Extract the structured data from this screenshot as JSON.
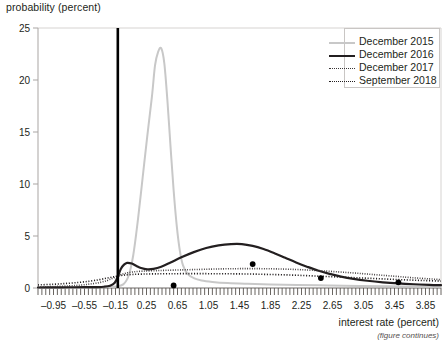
{
  "chart_data": {
    "type": "line",
    "title": "",
    "ylabel": "probability (percent)",
    "xlabel": "interest rate (percent)",
    "note": "(figure continues)",
    "grid": false,
    "legend_position": "top-right",
    "xlim": [
      -1.15,
      4.05
    ],
    "ylim": [
      0,
      25
    ],
    "xticks": [
      "-0.95",
      "-0.55",
      "-0.15",
      "0.25",
      "0.65",
      "1.05",
      "1.45",
      "1.85",
      "2.25",
      "2.65",
      "3.05",
      "3.45",
      "3.85"
    ],
    "xtick_values": [
      -0.95,
      -0.55,
      -0.15,
      0.25,
      0.65,
      1.05,
      1.45,
      1.85,
      2.25,
      2.65,
      3.05,
      3.45,
      3.85
    ],
    "xtick_minor_step": 0.05,
    "yticks": [
      "0",
      "5",
      "10",
      "15",
      "20",
      "25"
    ],
    "ytick_values": [
      0,
      5,
      10,
      15,
      20,
      25
    ],
    "vertical_marker": {
      "label": "",
      "x": -0.12,
      "color": "#000000"
    },
    "markers": {
      "color": "#000000",
      "points": [
        {
          "x": 0.6,
          "y": 0.25
        },
        {
          "x": 1.62,
          "y": 2.3
        },
        {
          "x": 2.5,
          "y": 0.95
        },
        {
          "x": 3.5,
          "y": 0.55
        }
      ]
    },
    "series": [
      {
        "name": "December 2015",
        "color": "#c8c8c8",
        "style": "solid",
        "width": 2.0,
        "points": [
          [
            -1.15,
            0.02
          ],
          [
            -0.95,
            0.03
          ],
          [
            -0.75,
            0.04
          ],
          [
            -0.55,
            0.05
          ],
          [
            -0.4,
            0.07
          ],
          [
            -0.25,
            0.1
          ],
          [
            -0.15,
            0.15
          ],
          [
            -0.05,
            0.35
          ],
          [
            0.02,
            1.2
          ],
          [
            0.08,
            3.2
          ],
          [
            0.14,
            6.6
          ],
          [
            0.2,
            10.6
          ],
          [
            0.26,
            14.6
          ],
          [
            0.32,
            18.4
          ],
          [
            0.36,
            21.4
          ],
          [
            0.4,
            22.7
          ],
          [
            0.44,
            23.05
          ],
          [
            0.48,
            21.6
          ],
          [
            0.52,
            18.0
          ],
          [
            0.56,
            13.6
          ],
          [
            0.6,
            9.4
          ],
          [
            0.64,
            6.0
          ],
          [
            0.68,
            3.6
          ],
          [
            0.72,
            2.2
          ],
          [
            0.78,
            1.35
          ],
          [
            0.86,
            0.95
          ],
          [
            0.96,
            0.72
          ],
          [
            1.1,
            0.58
          ],
          [
            1.3,
            0.47
          ],
          [
            1.55,
            0.4
          ],
          [
            1.85,
            0.34
          ],
          [
            2.2,
            0.29
          ],
          [
            2.6,
            0.24
          ],
          [
            3.0,
            0.2
          ],
          [
            3.4,
            0.16
          ],
          [
            3.8,
            0.13
          ],
          [
            4.05,
            0.11
          ]
        ]
      },
      {
        "name": "December 2016",
        "color": "#231f20",
        "style": "solid",
        "width": 2.2,
        "points": [
          [
            -1.15,
            0.05
          ],
          [
            -0.95,
            0.06
          ],
          [
            -0.75,
            0.07
          ],
          [
            -0.55,
            0.08
          ],
          [
            -0.4,
            0.09
          ],
          [
            -0.3,
            0.12
          ],
          [
            -0.22,
            0.22
          ],
          [
            -0.16,
            0.5
          ],
          [
            -0.12,
            1.1
          ],
          [
            -0.08,
            1.85
          ],
          [
            -0.04,
            2.25
          ],
          [
            0.0,
            2.42
          ],
          [
            0.06,
            2.35
          ],
          [
            0.12,
            2.12
          ],
          [
            0.18,
            1.92
          ],
          [
            0.26,
            1.8
          ],
          [
            0.34,
            1.84
          ],
          [
            0.44,
            2.05
          ],
          [
            0.56,
            2.45
          ],
          [
            0.7,
            2.95
          ],
          [
            0.86,
            3.45
          ],
          [
            1.02,
            3.85
          ],
          [
            1.18,
            4.1
          ],
          [
            1.34,
            4.22
          ],
          [
            1.48,
            4.22
          ],
          [
            1.62,
            4.05
          ],
          [
            1.76,
            3.75
          ],
          [
            1.9,
            3.35
          ],
          [
            2.04,
            2.9
          ],
          [
            2.18,
            2.45
          ],
          [
            2.32,
            2.05
          ],
          [
            2.46,
            1.68
          ],
          [
            2.6,
            1.38
          ],
          [
            2.76,
            1.1
          ],
          [
            2.92,
            0.88
          ],
          [
            3.1,
            0.7
          ],
          [
            3.3,
            0.55
          ],
          [
            3.5,
            0.44
          ],
          [
            3.7,
            0.36
          ],
          [
            3.9,
            0.3
          ],
          [
            4.05,
            0.27
          ]
        ]
      },
      {
        "name": "December 2017",
        "color": "#3b3637",
        "style": "dotted-fine",
        "width": 1.6,
        "points": [
          [
            -1.15,
            0.1
          ],
          [
            -0.95,
            0.14
          ],
          [
            -0.75,
            0.2
          ],
          [
            -0.6,
            0.28
          ],
          [
            -0.48,
            0.38
          ],
          [
            -0.36,
            0.52
          ],
          [
            -0.26,
            0.72
          ],
          [
            -0.18,
            0.96
          ],
          [
            -0.1,
            1.22
          ],
          [
            -0.02,
            1.42
          ],
          [
            0.08,
            1.55
          ],
          [
            0.2,
            1.62
          ],
          [
            0.34,
            1.66
          ],
          [
            0.5,
            1.7
          ],
          [
            0.7,
            1.74
          ],
          [
            0.9,
            1.78
          ],
          [
            1.1,
            1.82
          ],
          [
            1.3,
            1.85
          ],
          [
            1.5,
            1.86
          ],
          [
            1.7,
            1.86
          ],
          [
            1.9,
            1.84
          ],
          [
            2.1,
            1.8
          ],
          [
            2.3,
            1.74
          ],
          [
            2.5,
            1.66
          ],
          [
            2.7,
            1.56
          ],
          [
            2.9,
            1.46
          ],
          [
            3.1,
            1.34
          ],
          [
            3.3,
            1.22
          ],
          [
            3.5,
            1.1
          ],
          [
            3.7,
            0.98
          ],
          [
            3.9,
            0.88
          ],
          [
            4.05,
            0.8
          ]
        ]
      },
      {
        "name": "September 2018",
        "color": "#231f20",
        "style": "dotted",
        "width": 1.6,
        "points": [
          [
            -1.15,
            0.3
          ],
          [
            -0.95,
            0.36
          ],
          [
            -0.78,
            0.44
          ],
          [
            -0.62,
            0.54
          ],
          [
            -0.48,
            0.66
          ],
          [
            -0.36,
            0.8
          ],
          [
            -0.26,
            0.95
          ],
          [
            -0.16,
            1.1
          ],
          [
            -0.06,
            1.22
          ],
          [
            0.06,
            1.3
          ],
          [
            0.2,
            1.34
          ],
          [
            0.36,
            1.36
          ],
          [
            0.54,
            1.37
          ],
          [
            0.74,
            1.38
          ],
          [
            0.96,
            1.38
          ],
          [
            1.18,
            1.37
          ],
          [
            1.4,
            1.36
          ],
          [
            1.62,
            1.34
          ],
          [
            1.84,
            1.3
          ],
          [
            2.06,
            1.26
          ],
          [
            2.28,
            1.2
          ],
          [
            2.5,
            1.13
          ],
          [
            2.72,
            1.06
          ],
          [
            2.94,
            0.99
          ],
          [
            3.16,
            0.92
          ],
          [
            3.38,
            0.85
          ],
          [
            3.6,
            0.78
          ],
          [
            3.82,
            0.72
          ],
          [
            4.05,
            0.66
          ]
        ]
      }
    ]
  },
  "legend": {
    "items": [
      {
        "label": "December 2015"
      },
      {
        "label": "December 2016"
      },
      {
        "label": "December 2017"
      },
      {
        "label": "September 2018"
      }
    ]
  },
  "axes": {
    "y_title": "probability (percent)",
    "x_title": "interest rate (percent)",
    "footnote": "(figure continues)"
  }
}
